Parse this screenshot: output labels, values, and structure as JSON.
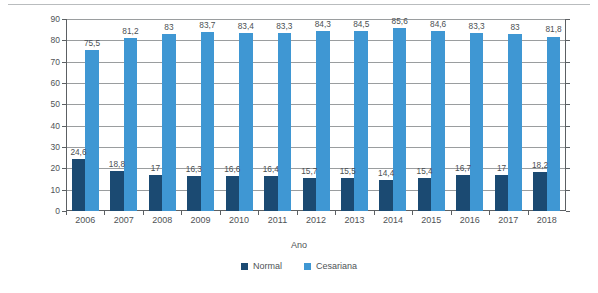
{
  "chart_data": {
    "type": "bar",
    "title": "",
    "xlabel": "Ano",
    "ylabel": "Taxas de partos normais e cesarianas",
    "categories": [
      "2006",
      "2007",
      "2008",
      "2009",
      "2010",
      "2011",
      "2012",
      "2013",
      "2014",
      "2015",
      "2016",
      "2017",
      "2018"
    ],
    "series": [
      {
        "name": "Normal",
        "color": "#1b4a72",
        "values": [
          24.6,
          18.8,
          17,
          16.3,
          16.6,
          16.4,
          15.7,
          15.5,
          14.4,
          15.4,
          16.7,
          17,
          18.2
        ],
        "labels": [
          "24,6",
          "18,8",
          "17",
          "16,3",
          "16,6",
          "16,4",
          "15,7",
          "15,5",
          "14,4",
          "15,4",
          "16,7",
          "17",
          "18,2"
        ]
      },
      {
        "name": "Cesariana",
        "color": "#3f97d3",
        "values": [
          75.5,
          81.2,
          83,
          83.7,
          83.4,
          83.3,
          84.3,
          84.5,
          85.6,
          84.6,
          83.3,
          83,
          81.8
        ],
        "labels": [
          "75,5",
          "81,2",
          "83",
          "83,7",
          "83,4",
          "83,3",
          "84,3",
          "84,5",
          "85,6",
          "84,6",
          "83,3",
          "83",
          "81,8"
        ]
      }
    ],
    "ylim": [
      0,
      90
    ],
    "yticks": [
      0,
      10,
      20,
      30,
      40,
      50,
      60,
      70,
      80,
      90
    ],
    "ytick_labels": [
      "0",
      "10",
      "20",
      "30",
      "40",
      "50",
      "60",
      "70",
      "80",
      "90"
    ],
    "grid": true,
    "legend_position": "bottom",
    "legend": [
      {
        "label": "Normal",
        "color": "#1b4a72"
      },
      {
        "label": "Cesariana",
        "color": "#3f97d3"
      }
    ]
  }
}
